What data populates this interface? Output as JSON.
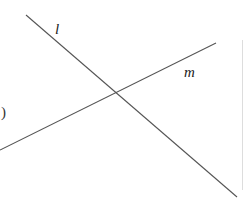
{
  "diagram": {
    "lines": [
      {
        "name": "l",
        "x1": 26,
        "y1": 15,
        "x2": 237,
        "y2": 197,
        "color": "#555555"
      },
      {
        "name": "m",
        "x1": 0,
        "y1": 150,
        "x2": 216,
        "y2": 43,
        "color": "#555555"
      }
    ],
    "labels": {
      "l": "l",
      "m": "m",
      "fragment": ")"
    },
    "intersection": {
      "x": 117,
      "y": 92
    },
    "edge_rule": {
      "x": 242,
      "y1": 40,
      "y2": 190,
      "color": "#dddddd"
    }
  }
}
